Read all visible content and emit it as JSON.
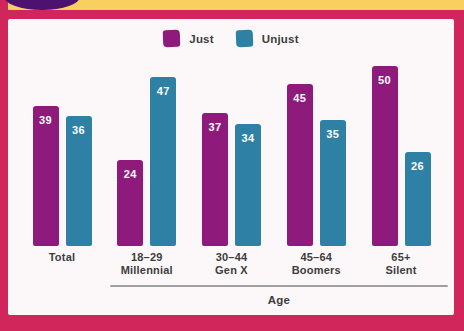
{
  "colors": {
    "just": "#8e1b7b",
    "unjust": "#2e81a4",
    "frame": "#d0265c",
    "top_strip": "#f9d060",
    "logo_blob": "#4d1170",
    "panel_bg": "#fcf8f9",
    "label_text": "#3c3c3c",
    "axis_line": "#8f8f8f",
    "value_text": "#ffffff"
  },
  "chart_data": {
    "type": "bar",
    "title": "",
    "xlabel": "Age",
    "ylabel": "",
    "ylim": [
      0,
      52
    ],
    "grid": false,
    "legend_position": "top-center",
    "value_labels": "inside-bar-top",
    "categories": [
      "Total",
      "18–29 Millennial",
      "30–44 Gen X",
      "45–64 Boomers",
      "65+ Silent"
    ],
    "groups": [
      {
        "label_line1": "Total",
        "label_line2": "",
        "just": 39,
        "unjust": 36
      },
      {
        "label_line1": "18–29",
        "label_line2": "Millennial",
        "just": 24,
        "unjust": 47
      },
      {
        "label_line1": "30–44",
        "label_line2": "Gen X",
        "just": 37,
        "unjust": 34
      },
      {
        "label_line1": "45–64",
        "label_line2": "Boomers",
        "just": 45,
        "unjust": 35
      },
      {
        "label_line1": "65+",
        "label_line2": "Silent",
        "just": 50,
        "unjust": 26
      }
    ],
    "series": [
      {
        "name": "Just",
        "values": [
          39,
          24,
          37,
          45,
          50
        ]
      },
      {
        "name": "Unjust",
        "values": [
          36,
          47,
          34,
          35,
          26
        ]
      }
    ]
  },
  "legend": {
    "items": [
      {
        "label": "Just",
        "series_key": "just"
      },
      {
        "label": "Unjust",
        "series_key": "unjust"
      }
    ]
  }
}
